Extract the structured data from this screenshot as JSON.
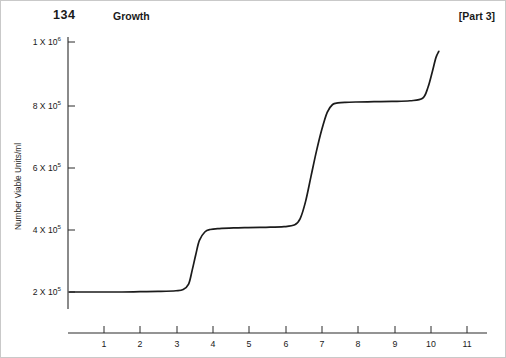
{
  "running_head": {
    "folio": "134",
    "title": "Growth",
    "part": "[Part 3]"
  },
  "chart_data": {
    "type": "line",
    "title": "",
    "xlabel": "Time (hours)",
    "ylabel": "Number Viable Units/ml",
    "xlim": [
      0,
      11.6
    ],
    "ylim": [
      140000,
      1060000
    ],
    "grid": false,
    "legend": null,
    "xticks": [
      1,
      2,
      3,
      4,
      5,
      6,
      7,
      8,
      9,
      10,
      11
    ],
    "xticklabels": [
      "1",
      "2",
      "3",
      "4",
      "5",
      "6",
      "7",
      "8",
      "9",
      "10",
      "11"
    ],
    "yticks": [
      200000,
      400000,
      600000,
      800000,
      1000000
    ],
    "yticklabels": [
      {
        "mantissa": "2 X 10",
        "exponent": "5"
      },
      {
        "mantissa": "4 X 10",
        "exponent": "5"
      },
      {
        "mantissa": "6 X 10",
        "exponent": "5"
      },
      {
        "mantissa": "8 X 10",
        "exponent": "5"
      },
      {
        "mantissa": "1 X 10",
        "exponent": "6"
      }
    ],
    "series": [
      {
        "name": "viable units",
        "x": [
          0.05,
          0.5,
          1.0,
          1.5,
          2.0,
          2.5,
          3.0,
          3.2,
          3.35,
          3.45,
          3.55,
          3.65,
          3.8,
          3.95,
          4.2,
          4.6,
          5.0,
          5.5,
          6.0,
          6.3,
          6.45,
          6.6,
          6.75,
          6.9,
          7.05,
          7.2,
          7.35,
          7.5,
          7.7,
          8.0,
          8.5,
          9.0,
          9.5,
          9.85,
          10.0,
          10.12,
          10.22,
          10.3
        ],
        "y": [
          200000,
          200000,
          200000,
          200000,
          201000,
          202000,
          204000,
          208000,
          225000,
          270000,
          320000,
          365000,
          392000,
          400000,
          403000,
          405000,
          406000,
          407000,
          409000,
          415000,
          435000,
          490000,
          570000,
          650000,
          720000,
          775000,
          800000,
          805000,
          807000,
          808000,
          809000,
          810000,
          812000,
          820000,
          855000,
          905000,
          950000,
          970000
        ]
      }
    ]
  }
}
